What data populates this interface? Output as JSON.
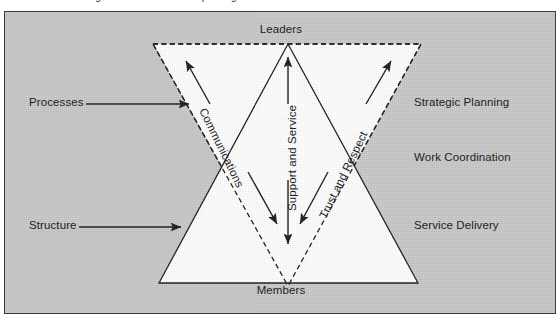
{
  "figure": {
    "caption_partial": "organizational relationship triangle model",
    "background_color": "#c9c9c9",
    "frame_border_color": "#3a3a3a",
    "triangle_fill": "#ffffff",
    "line_color": "#1d1d1d"
  },
  "vertex_labels": {
    "top": "Leaders",
    "bottom": "Members"
  },
  "left_labels": [
    {
      "text": "Processes"
    },
    {
      "text": "Structure"
    }
  ],
  "right_labels": [
    {
      "text": "Strategic Planning"
    },
    {
      "text": "Work Coordination"
    },
    {
      "text": "Service Delivery"
    }
  ],
  "axis_labels": [
    {
      "text": "Communications",
      "orientation": "diagonal-down-right"
    },
    {
      "text": "Support and Service",
      "orientation": "vertical"
    },
    {
      "text": "Trust and Respect",
      "orientation": "diagonal-up-right"
    }
  ],
  "shapes": {
    "inverted_triangle": {
      "name": "Leaders triangle",
      "stroke": "dashed"
    },
    "upright_triangle": {
      "name": "Members triangle",
      "stroke": "solid"
    }
  },
  "connectors": {
    "left_arrow_label": "Processes connector",
    "lower_left_arrow_label": "Structure connector",
    "bidirectional_count": 3
  }
}
